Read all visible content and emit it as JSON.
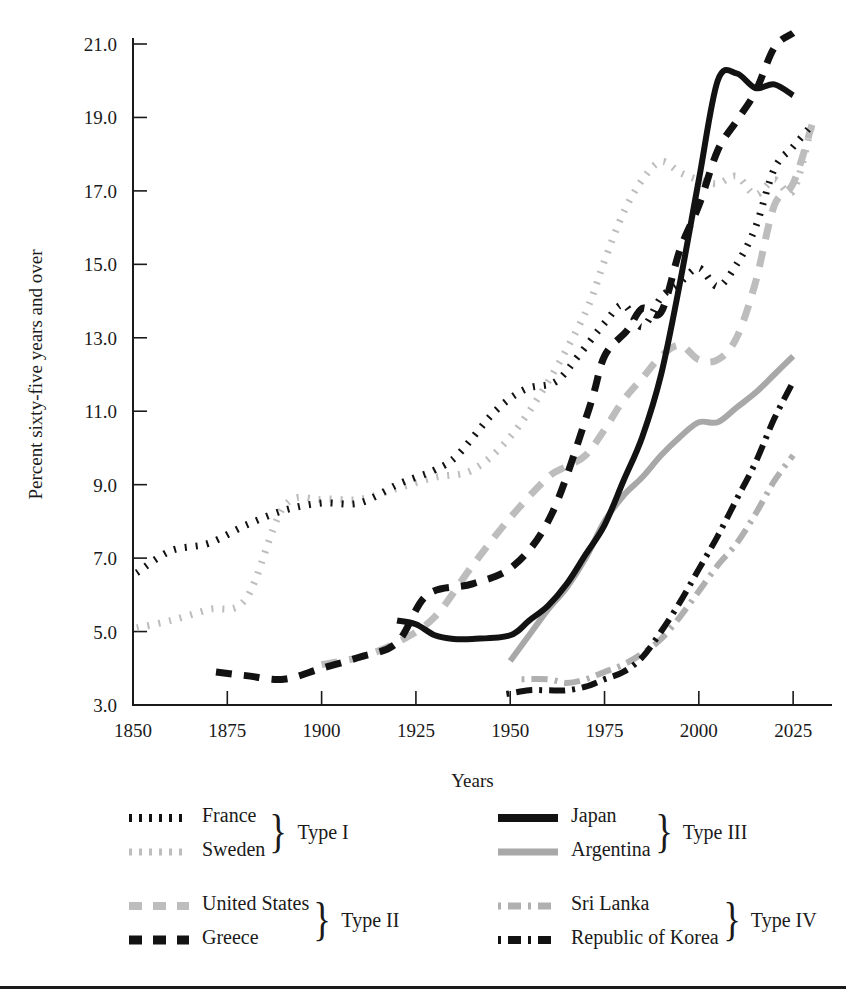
{
  "chart_data": {
    "type": "line",
    "title": "",
    "xlabel": "Years",
    "ylabel": "Percent sixty-five years and over",
    "xlim": [
      1850,
      2030
    ],
    "ylim": [
      3.0,
      21.0
    ],
    "grid": false,
    "legend_position": "below",
    "xticks": [
      "1850",
      "1875",
      "1900",
      "1925",
      "1950",
      "1975",
      "2000",
      "2025"
    ],
    "xtick_values": [
      1850,
      1875,
      1900,
      1925,
      1950,
      1975,
      2000,
      2025
    ],
    "yticks": [
      "3.0",
      "5.0",
      "7.0",
      "9.0",
      "11.0",
      "13.0",
      "15.0",
      "17.0",
      "19.0",
      "21.0"
    ],
    "ytick_values": [
      3.0,
      5.0,
      7.0,
      9.0,
      11.0,
      13.0,
      15.0,
      17.0,
      19.0,
      21.0
    ],
    "series": [
      {
        "name": "France",
        "group": "Type I",
        "color": "#121212",
        "style": "dotted",
        "stroke_width": 7,
        "dash": "2,9",
        "x": [
          1851,
          1860,
          1870,
          1880,
          1890,
          1900,
          1910,
          1920,
          1925,
          1930,
          1936,
          1946,
          1954,
          1962,
          1968,
          1975,
          1980,
          1985,
          1990,
          1995,
          2000,
          2005,
          2010,
          2015,
          2020,
          2025,
          2030
        ],
        "y": [
          6.6,
          7.2,
          7.4,
          7.9,
          8.3,
          8.5,
          8.5,
          9.0,
          9.2,
          9.4,
          9.8,
          11.0,
          11.6,
          11.8,
          12.5,
          13.4,
          13.9,
          13.3,
          14.1,
          14.5,
          14.9,
          14.4,
          15.0,
          16.0,
          17.6,
          18.2,
          18.8
        ]
      },
      {
        "name": "Sweden",
        "group": "Type I",
        "color": "#bdbdbd",
        "style": "dotted",
        "stroke_width": 7,
        "dash": "2,9",
        "x": [
          1851,
          1860,
          1870,
          1880,
          1890,
          1900,
          1910,
          1920,
          1930,
          1940,
          1950,
          1960,
          1970,
          1975,
          1980,
          1985,
          1990,
          1995,
          2000,
          2005,
          2010,
          2015,
          2020,
          2025,
          2030
        ],
        "y": [
          5.1,
          5.3,
          5.6,
          5.9,
          8.4,
          8.6,
          8.6,
          8.9,
          9.2,
          9.4,
          10.3,
          11.8,
          13.7,
          15.1,
          16.4,
          17.3,
          17.8,
          17.5,
          17.3,
          17.2,
          17.4,
          16.9,
          17.3,
          17.0,
          18.8
        ]
      },
      {
        "name": "United States",
        "group": "Type II",
        "color": "#bdbdbd",
        "style": "dashed",
        "stroke_width": 7,
        "dash": "16,12",
        "x": [
          1900,
          1910,
          1920,
          1930,
          1940,
          1950,
          1960,
          1965,
          1970,
          1975,
          1980,
          1985,
          1990,
          1995,
          2000,
          2005,
          2010,
          2015,
          2020,
          2025,
          2030
        ],
        "y": [
          4.1,
          4.3,
          4.7,
          5.4,
          6.8,
          8.1,
          9.2,
          9.5,
          9.8,
          10.5,
          11.3,
          11.9,
          12.5,
          12.8,
          12.4,
          12.4,
          13.0,
          14.5,
          16.6,
          17.2,
          18.8
        ]
      },
      {
        "name": "Greece",
        "group": "Type II",
        "color": "#121212",
        "style": "dashed",
        "stroke_width": 7,
        "dash": "16,12",
        "x": [
          1872,
          1880,
          1890,
          1900,
          1910,
          1920,
          1928,
          1940,
          1951,
          1961,
          1971,
          1975,
          1981,
          1985,
          1990,
          1995,
          2000,
          2005,
          2010,
          2015,
          2020,
          2025
        ],
        "y": [
          3.9,
          3.8,
          3.7,
          4.0,
          4.3,
          4.7,
          6.0,
          6.3,
          6.8,
          8.2,
          11.1,
          12.5,
          13.2,
          13.8,
          13.7,
          15.4,
          16.6,
          18.1,
          18.9,
          19.7,
          20.9,
          21.3
        ]
      },
      {
        "name": "Japan",
        "group": "Type III",
        "color": "#121212",
        "style": "solid",
        "stroke_width": 6,
        "dash": "",
        "x": [
          1920,
          1925,
          1930,
          1935,
          1940,
          1950,
          1955,
          1960,
          1965,
          1970,
          1975,
          1980,
          1985,
          1990,
          1995,
          2000,
          2005,
          2010,
          2015,
          2020,
          2025
        ],
        "y": [
          5.3,
          5.2,
          4.9,
          4.8,
          4.8,
          4.9,
          5.3,
          5.7,
          6.3,
          7.1,
          7.9,
          9.1,
          10.3,
          12.0,
          14.5,
          17.3,
          20.0,
          20.2,
          19.8,
          19.9,
          19.6
        ]
      },
      {
        "name": "Argentina",
        "group": "Type III",
        "color": "#a8a8a8",
        "style": "solid",
        "stroke_width": 6,
        "dash": "",
        "x": [
          1950,
          1955,
          1960,
          1965,
          1970,
          1975,
          1980,
          1985,
          1990,
          1995,
          2000,
          2005,
          2010,
          2015,
          2020,
          2025
        ],
        "y": [
          4.2,
          4.9,
          5.6,
          6.2,
          7.0,
          8.0,
          8.7,
          9.2,
          9.8,
          10.3,
          10.7,
          10.7,
          11.1,
          11.5,
          12.0,
          12.5
        ]
      },
      {
        "name": "Sri Lanka",
        "group": "Type IV",
        "color": "#b0b0b0",
        "style": "dashdot",
        "stroke_width": 6,
        "dash": "3,7,16,7",
        "x": [
          1953,
          1960,
          1965,
          1970,
          1975,
          1980,
          1985,
          1990,
          1995,
          2000,
          2005,
          2010,
          2015,
          2020,
          2025
        ],
        "y": [
          3.7,
          3.7,
          3.6,
          3.7,
          3.9,
          4.1,
          4.4,
          4.8,
          5.4,
          6.1,
          6.8,
          7.4,
          8.2,
          9.1,
          9.8
        ]
      },
      {
        "name": "Republic of Korea",
        "group": "Type IV",
        "color": "#121212",
        "style": "dashdot",
        "stroke_width": 6,
        "dash": "3,7,16,7",
        "x": [
          1949,
          1955,
          1960,
          1965,
          1970,
          1975,
          1980,
          1985,
          1990,
          1995,
          2000,
          2005,
          2010,
          2015,
          2020,
          2025
        ],
        "y": [
          3.3,
          3.4,
          3.4,
          3.4,
          3.5,
          3.7,
          3.9,
          4.3,
          5.0,
          5.8,
          6.7,
          7.6,
          8.6,
          9.6,
          10.8,
          11.8
        ]
      }
    ]
  },
  "axes": {
    "ylabel": "Percent sixty-five years and over",
    "xlabel": "Years"
  },
  "legend": {
    "groups": [
      {
        "type_label": "Type I",
        "entries": [
          {
            "label": "France",
            "style": "dotted-dark"
          },
          {
            "label": "Sweden",
            "style": "dotted-light"
          }
        ]
      },
      {
        "type_label": "Type III",
        "entries": [
          {
            "label": "Japan",
            "style": "solid-dark"
          },
          {
            "label": "Argentina",
            "style": "solid-light"
          }
        ]
      },
      {
        "type_label": "Type II",
        "entries": [
          {
            "label": "United States",
            "style": "dashed-light"
          },
          {
            "label": "Greece",
            "style": "dashed-dark"
          }
        ]
      },
      {
        "type_label": "Type IV",
        "entries": [
          {
            "label": "Sri Lanka",
            "style": "dashdot-light"
          },
          {
            "label": "Republic of Korea",
            "style": "dashdot-dark"
          }
        ]
      }
    ],
    "brace_glyph": "}"
  }
}
